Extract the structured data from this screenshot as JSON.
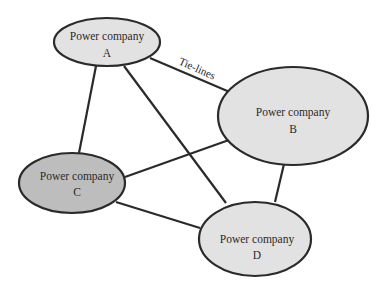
{
  "diagram": {
    "type": "network",
    "edge_label": "Tie-lines",
    "colors": {
      "light_fill": "#e2e2e2",
      "dark_fill": "#bdbdbd",
      "stroke": "#2a2a2a"
    },
    "nodes": [
      {
        "id": "A",
        "line1": "Power company",
        "line2": "A"
      },
      {
        "id": "B",
        "line1": "Power company",
        "line2": "B"
      },
      {
        "id": "C",
        "line1": "Power company",
        "line2": "C"
      },
      {
        "id": "D",
        "line1": "Power company",
        "line2": "D"
      }
    ],
    "edges": [
      [
        "A",
        "B"
      ],
      [
        "A",
        "C"
      ],
      [
        "A",
        "D"
      ],
      [
        "B",
        "C"
      ],
      [
        "B",
        "D"
      ],
      [
        "C",
        "D"
      ]
    ]
  }
}
